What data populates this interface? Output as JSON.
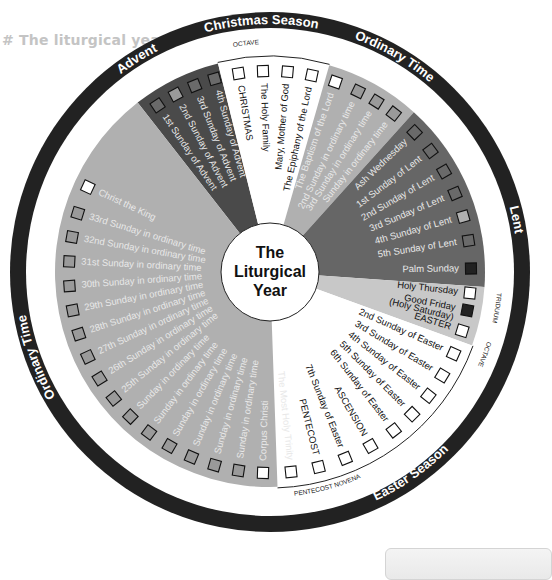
{
  "page": {
    "heading": "# The liturgical year"
  },
  "center": {
    "title_lines": [
      "The",
      "Liturgical",
      "Year"
    ]
  },
  "colors": {
    "ring": "#222222",
    "advent": "#4a4a4a",
    "lent": "#666666",
    "ordinary": "#b0b0b0",
    "triduum": "#c8c8c8",
    "feast_white": "#ffffff",
    "label_light": "#e8e8e8",
    "label_dark": "#111111"
  },
  "seasons": [
    {
      "name": "Advent",
      "label_angle": -32
    },
    {
      "name": "Christmas Season",
      "label_angle": -2
    },
    {
      "name": "Ordinary Time",
      "label_angle": 30
    },
    {
      "name": "Lent",
      "label_angle": 78
    },
    {
      "name": "Easter Season",
      "label_angle": 145
    },
    {
      "name": "Ordinary Time",
      "label_angle": 250
    }
  ],
  "small_labels": [
    {
      "text": "OCTAVE",
      "angle": -6
    },
    {
      "text": "TRIDUUM",
      "angle": 99
    },
    {
      "text": "OCTAVE",
      "angle": 111
    },
    {
      "text": "PENTECOST NOVENA",
      "angle": 165
    }
  ],
  "wedges": [
    {
      "id": "advent",
      "start": -38,
      "end": -14,
      "fill": "#4a4a4a"
    },
    {
      "id": "christmas",
      "start": -14,
      "end": 16,
      "fill": "#ffffff"
    },
    {
      "id": "ordinary-early",
      "start": 16,
      "end": 42,
      "fill": "#b0b0b0"
    },
    {
      "id": "lent",
      "start": 42,
      "end": 94,
      "fill": "#666666"
    },
    {
      "id": "triduum",
      "start": 94,
      "end": 110,
      "fill": "#c8c8c8"
    },
    {
      "id": "easter",
      "start": 110,
      "end": 178,
      "fill": "#ffffff"
    },
    {
      "id": "ordinary-late",
      "start": 178,
      "end": 322,
      "fill": "#b0b0b0"
    }
  ],
  "entries": [
    {
      "label": "1st Sunday of Advent",
      "angle": -34,
      "box": "#6a6a6a",
      "text": "light"
    },
    {
      "label": "2nd Sunday of Advent",
      "angle": -28,
      "box": "#9a9a9a",
      "text": "light"
    },
    {
      "label": "3rd Sunday of Advent",
      "angle": -22,
      "box": "#6a6a6a",
      "text": "light"
    },
    {
      "label": "4th Sunday of Advent",
      "angle": -16,
      "box": "#6a6a6a",
      "text": "light"
    },
    {
      "label": "CHRISTMAS",
      "angle": -9,
      "box": "#ffffff",
      "text": "dark"
    },
    {
      "label": "The Holy Family",
      "angle": -2,
      "box": "#ffffff",
      "text": "dark"
    },
    {
      "label": "Mary, Mother of God",
      "angle": 5,
      "box": "#ffffff",
      "text": "dark"
    },
    {
      "label": "The Epiphany of the Lord",
      "angle": 12,
      "box": "#ffffff",
      "text": "dark"
    },
    {
      "label": "The Baptism of the Lord",
      "angle": 19,
      "box": "#ffffff",
      "text": "light"
    },
    {
      "label": "2nd Sunday in ordinary time",
      "angle": 26,
      "box": "#9a9a9a",
      "text": "light"
    },
    {
      "label": "3rd Sunday in ordinary time",
      "angle": 32,
      "box": "#9a9a9a",
      "text": "light"
    },
    {
      "label": "Sunday in ordinary time",
      "angle": 38,
      "box": "#9a9a9a",
      "text": "light"
    },
    {
      "label": "Ash Wednesday",
      "angle": 46,
      "box": "#6a6a6a",
      "text": "light"
    },
    {
      "label": "1st Sunday of Lent",
      "angle": 53,
      "box": "#6a6a6a",
      "text": "light"
    },
    {
      "label": "2nd Sunday of Lent",
      "angle": 60,
      "box": "#6a6a6a",
      "text": "light"
    },
    {
      "label": "3rd Sunday of Lent",
      "angle": 67,
      "box": "#6a6a6a",
      "text": "light"
    },
    {
      "label": "4th Sunday of Lent",
      "angle": 74,
      "box": "#b0b0b0",
      "text": "light"
    },
    {
      "label": "5th Sunday of Lent",
      "angle": 81,
      "box": "#6a6a6a",
      "text": "light"
    },
    {
      "label": "Palm Sunday",
      "angle": 89,
      "box": "#222222",
      "text": "light"
    },
    {
      "label": "Holy Thursday",
      "angle": 96,
      "box": "#ffffff",
      "text": "dark"
    },
    {
      "label": "Good Friday",
      "angle": 101,
      "box": "#222222",
      "text": "dark"
    },
    {
      "label": "(Holy Saturday)",
      "angle": 104,
      "box": "",
      "text": "dark"
    },
    {
      "label": "EASTER",
      "angle": 107,
      "box": "#ffffff",
      "text": "dark"
    },
    {
      "label": "2nd Sunday of Easter",
      "angle": 114,
      "box": "#ffffff",
      "text": "dark"
    },
    {
      "label": "3rd Sunday of Easter",
      "angle": 121,
      "box": "#ffffff",
      "text": "dark"
    },
    {
      "label": "4th Sunday of Easter",
      "angle": 128,
      "box": "#ffffff",
      "text": "dark"
    },
    {
      "label": "5th Sunday of Easter",
      "angle": 135,
      "box": "#ffffff",
      "text": "dark"
    },
    {
      "label": "6th Sunday of Easter",
      "angle": 142,
      "box": "#ffffff",
      "text": "dark"
    },
    {
      "label": "ASCENSION",
      "angle": 150,
      "box": "#ffffff",
      "text": "dark"
    },
    {
      "label": "7th Sunday of Easter",
      "angle": 158,
      "box": "#ffffff",
      "text": "dark"
    },
    {
      "label": "PENTECOST",
      "angle": 166,
      "box": "#ffffff",
      "text": "dark"
    },
    {
      "label": "The Most Holy Trinity",
      "angle": 174,
      "box": "#ffffff",
      "text": "light"
    },
    {
      "label": "Corpus Christi",
      "angle": 182,
      "box": "#ffffff",
      "text": "light"
    },
    {
      "label": "Sunday in ordinary time",
      "angle": 189,
      "box": "#9a9a9a",
      "text": "light"
    },
    {
      "label": "Sunday in ordinary time",
      "angle": 196,
      "box": "#9a9a9a",
      "text": "light"
    },
    {
      "label": "Sunday in ordinary time",
      "angle": 203,
      "box": "#9a9a9a",
      "text": "light"
    },
    {
      "label": "Sunday in ordinary time",
      "angle": 210,
      "box": "#9a9a9a",
      "text": "light"
    },
    {
      "label": "Sunday in ordinary time",
      "angle": 217,
      "box": "#9a9a9a",
      "text": "light"
    },
    {
      "label": "Sunday in ordinary time",
      "angle": 224,
      "box": "#9a9a9a",
      "text": "light"
    },
    {
      "label": "25th Sunday in ordinary time",
      "angle": 231,
      "box": "#9a9a9a",
      "text": "light"
    },
    {
      "label": "26th Sunday in ordinary time",
      "angle": 238,
      "box": "#9a9a9a",
      "text": "light"
    },
    {
      "label": "27th Sunday in ordinary time",
      "angle": 245,
      "box": "#9a9a9a",
      "text": "light"
    },
    {
      "label": "28th Sunday in ordinary time",
      "angle": 252,
      "box": "#9a9a9a",
      "text": "light"
    },
    {
      "label": "29th Sunday in ordinary time",
      "angle": 259,
      "box": "#9a9a9a",
      "text": "light"
    },
    {
      "label": "30th Sunday in ordinary time",
      "angle": 266,
      "box": "#9a9a9a",
      "text": "light"
    },
    {
      "label": "31st Sunday in ordinary time",
      "angle": 273,
      "box": "#9a9a9a",
      "text": "light"
    },
    {
      "label": "32nd Sunday in ordinary time",
      "angle": 280,
      "box": "#9a9a9a",
      "text": "light"
    },
    {
      "label": "33rd Sunday in ordinary time",
      "angle": 287,
      "box": "#9a9a9a",
      "text": "light"
    },
    {
      "label": "Christ the King",
      "angle": 295,
      "box": "#ffffff",
      "text": "light"
    }
  ]
}
